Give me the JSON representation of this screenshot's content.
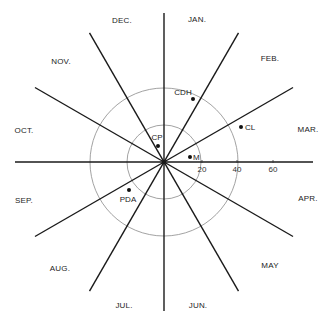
{
  "diagram": {
    "type": "polar-month-clock",
    "center": [
      164,
      162
    ],
    "spoke_length": 149,
    "spoke_color": "#1a1a1a",
    "ring_color": "#8a8a8a",
    "rings": [
      {
        "value": 20,
        "radius_px": 37
      },
      {
        "value": 40,
        "radius_px": 74
      }
    ],
    "scale_ticks": [
      {
        "label": "20",
        "x": 202,
        "y": 172
      },
      {
        "label": "40",
        "x": 237,
        "y": 172
      },
      {
        "label": "60",
        "x": 273,
        "y": 172
      }
    ],
    "spoke_angles_deg": [
      0,
      30,
      60,
      90,
      120,
      150
    ],
    "months": [
      {
        "label": "JAN.",
        "x": 197,
        "y": 22
      },
      {
        "label": "FEB.",
        "x": 270,
        "y": 61
      },
      {
        "label": "MAR.",
        "x": 308,
        "y": 132
      },
      {
        "label": "APR.",
        "x": 308,
        "y": 201
      },
      {
        "label": "MAY",
        "x": 270,
        "y": 268
      },
      {
        "label": "JUN.",
        "x": 198,
        "y": 308
      },
      {
        "label": "JUL.",
        "x": 124,
        "y": 308
      },
      {
        "label": "AUG.",
        "x": 60,
        "y": 271
      },
      {
        "label": "SEP.",
        "x": 24,
        "y": 203
      },
      {
        "label": "OCT.",
        "x": 24,
        "y": 133
      },
      {
        "label": "NOV.",
        "x": 61,
        "y": 64
      },
      {
        "label": "DEC.",
        "x": 122,
        "y": 23
      }
    ],
    "points": [
      {
        "label": "CDH",
        "x": 193,
        "y": 99,
        "lx": 183,
        "ly": 95,
        "anchor": "middle"
      },
      {
        "label": "CL",
        "x": 241,
        "y": 127,
        "lx": 245,
        "ly": 130,
        "anchor": "start"
      },
      {
        "label": "M",
        "x": 190,
        "y": 157,
        "lx": 193,
        "ly": 160,
        "anchor": "start"
      },
      {
        "label": "CP",
        "x": 158,
        "y": 146,
        "lx": 157,
        "ly": 140,
        "anchor": "middle"
      },
      {
        "label": "PDA",
        "x": 129,
        "y": 190,
        "lx": 128,
        "ly": 202,
        "anchor": "middle"
      }
    ]
  }
}
